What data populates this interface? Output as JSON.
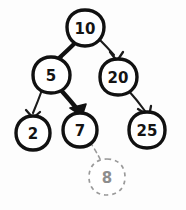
{
  "diagram": {
    "style": "hand-drawn sketch, black ink on white paper",
    "background_color": "#fdfdfd",
    "ink_color": "#141414",
    "ghost_color": "#9a9a9a",
    "highlight_color": "#000000"
  },
  "nodes": [
    {
      "id": "n10",
      "label": "10",
      "cx": 85,
      "cy": 28,
      "r": 18,
      "state": "solid",
      "role": "root"
    },
    {
      "id": "n5",
      "label": "5",
      "cx": 51,
      "cy": 75,
      "r": 18,
      "state": "solid",
      "role": "internal"
    },
    {
      "id": "n20",
      "label": "20",
      "cx": 118,
      "cy": 77,
      "r": 18,
      "state": "solid",
      "role": "internal"
    },
    {
      "id": "n2",
      "label": "2",
      "cx": 33,
      "cy": 133,
      "r": 17,
      "state": "solid",
      "role": "leaf"
    },
    {
      "id": "n7",
      "label": "7",
      "cx": 80,
      "cy": 130,
      "r": 17,
      "state": "solid",
      "role": "leaf"
    },
    {
      "id": "n25",
      "label": "25",
      "cx": 147,
      "cy": 130,
      "r": 18,
      "state": "solid",
      "role": "leaf"
    },
    {
      "id": "n8",
      "label": "8",
      "cx": 107,
      "cy": 177,
      "r": 18,
      "state": "dashed",
      "role": "inserted-preview"
    }
  ],
  "edges": [
    {
      "id": "e10-5",
      "from": "n10",
      "to": "n5",
      "emphasis": "bold",
      "arrow": true,
      "dashed": false
    },
    {
      "id": "e10-20",
      "from": "n10",
      "to": "n20",
      "emphasis": "normal",
      "arrow": true,
      "dashed": false
    },
    {
      "id": "e5-2",
      "from": "n5",
      "to": "n2",
      "emphasis": "normal",
      "arrow": true,
      "dashed": false
    },
    {
      "id": "e5-7",
      "from": "n5",
      "to": "n7",
      "emphasis": "bold",
      "arrow": true,
      "dashed": false
    },
    {
      "id": "e20-25",
      "from": "n20",
      "to": "n25",
      "emphasis": "normal",
      "arrow": true,
      "dashed": false
    },
    {
      "id": "e7-8",
      "from": "n7",
      "to": "n8",
      "emphasis": "normal",
      "arrow": false,
      "dashed": true
    }
  ],
  "highlight_path": [
    "n10",
    "n5",
    "n7",
    "n8"
  ]
}
